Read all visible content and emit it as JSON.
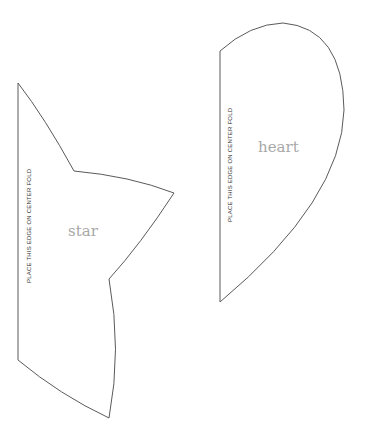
{
  "colors": {
    "background": "#ffffff",
    "outline": "#5a5a5a",
    "fold_text": "#333333",
    "shape_label": "#a8a8a8"
  },
  "shapes": [
    {
      "id": "star",
      "label": "star",
      "fold_text": "PLACE THIS EDGE ON CENTER FOLD"
    },
    {
      "id": "heart",
      "label": "heart",
      "fold_text": "PLACE THIS EDGE ON CENTER FOLD"
    }
  ]
}
